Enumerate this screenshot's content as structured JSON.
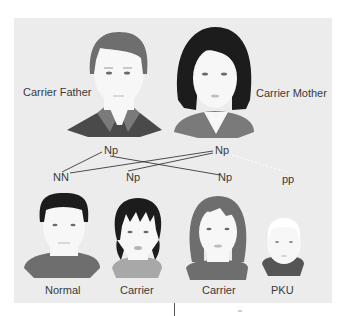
{
  "diagram": {
    "parents": [
      {
        "label": "Carrier Father",
        "genotype": "Np"
      },
      {
        "label": "Carrier Mother",
        "genotype": "Np"
      }
    ],
    "offspring": [
      {
        "label": "Normal",
        "genotype": "NN"
      },
      {
        "label": "Carrier",
        "genotype": "Np"
      },
      {
        "label": "Carrier",
        "genotype": "Np"
      },
      {
        "label": "PKU",
        "genotype": "pp"
      }
    ],
    "colors": {
      "background_panel": "#ececec",
      "text": "#3a3a3a",
      "hair_dark": "#1c1c1c",
      "hair_gray": "#6e6e6e",
      "skin": "#f7f7f7",
      "shirt_dark": "#4a4a4a",
      "shirt_mid": "#7a7a7a",
      "shirt_light": "#a8a8a8"
    }
  }
}
